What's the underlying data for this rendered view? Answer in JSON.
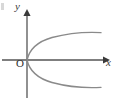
{
  "figure": {
    "kind": "coordinate-plane-diagram",
    "background_color": "#ffffff"
  },
  "axes": {
    "x_axis": {
      "label": "x",
      "color": "#555555",
      "arrow": "right",
      "y_position_px": 60,
      "start_px": 2,
      "end_px": 105
    },
    "y_axis": {
      "label": "y",
      "color": "#555555",
      "arrow": "up",
      "x_position_px": 27,
      "start_px": 10,
      "end_px": 98
    },
    "origin": {
      "label": "O",
      "x_px": 27,
      "y_px": 60
    }
  },
  "curve": {
    "name": "parabola",
    "equation": "y^2 = ax",
    "opening": "right",
    "vertex": [
      27,
      60
    ],
    "color": "#8a8a8a",
    "stroke_width": 1.4,
    "upper_branch_end": [
      101,
      33
    ],
    "lower_branch_end": [
      101,
      88
    ]
  },
  "colors": {
    "curve": "#8a8a8a",
    "axis": "#555555",
    "text": "#2e2e2e",
    "background": "#ffffff"
  }
}
